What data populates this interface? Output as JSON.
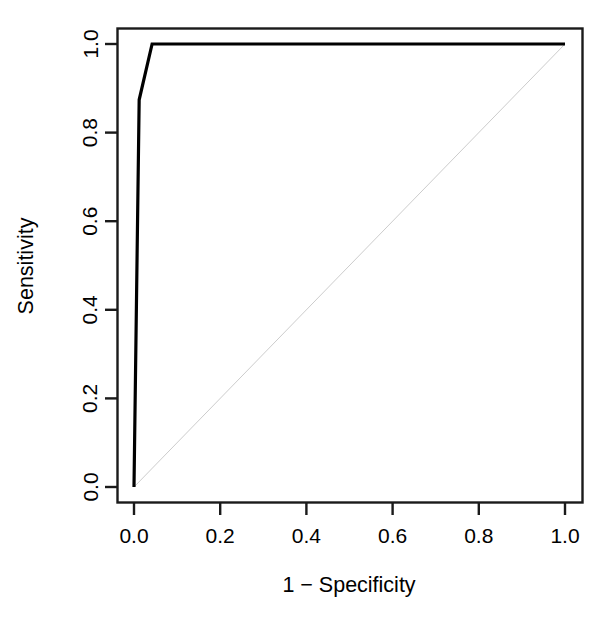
{
  "chart_data": {
    "type": "line",
    "title": "",
    "subtitle": "",
    "xlabel": "1 − Specificity",
    "ylabel": "Sensitivity",
    "xlim": [
      0.0,
      1.0
    ],
    "ylim": [
      0.0,
      1.0
    ],
    "grid": false,
    "legend": null,
    "background": "#ffffff",
    "xticks": [
      {
        "value": 0.0,
        "label": "0.0"
      },
      {
        "value": 0.2,
        "label": "0.2"
      },
      {
        "value": 0.4,
        "label": "0.4"
      },
      {
        "value": 0.6,
        "label": "0.6"
      },
      {
        "value": 0.8,
        "label": "0.8"
      },
      {
        "value": 1.0,
        "label": "1.0"
      }
    ],
    "yticks": [
      {
        "value": 0.0,
        "label": "0.0"
      },
      {
        "value": 0.2,
        "label": "0.2"
      },
      {
        "value": 0.4,
        "label": "0.4"
      },
      {
        "value": 0.6,
        "label": "0.6"
      },
      {
        "value": 0.8,
        "label": "0.8"
      },
      {
        "value": 1.0,
        "label": "1.0"
      }
    ],
    "series": [
      {
        "name": "ROC curve",
        "color": "#000000",
        "width": 3.2,
        "x": [
          0.0,
          0.012,
          0.042,
          1.0
        ],
        "y": [
          0.0,
          0.874,
          1.0,
          1.0
        ]
      },
      {
        "name": "Chance diagonal",
        "color": "#cccccc",
        "width": 1,
        "x": [
          0.0,
          1.0
        ],
        "y": [
          0.0,
          1.0
        ]
      }
    ],
    "annotations": []
  },
  "axis_labels": {
    "x_title": "1 − Specificity",
    "y_title": "Sensitivity"
  },
  "style": {
    "frame_color": "#1a1a1a",
    "tick_color": "#1a1a1a",
    "text_color": "#000000",
    "curve_color": "#000000",
    "diagonal_color": "#cccccc"
  }
}
